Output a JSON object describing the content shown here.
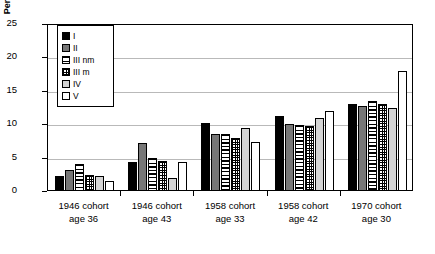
{
  "chart_data": {
    "type": "bar",
    "title": "",
    "xlabel": "",
    "ylabel": "Percentage",
    "ylim": [
      0,
      25
    ],
    "yticks": [
      "0",
      "5",
      "10",
      "15",
      "20",
      "25"
    ],
    "grid": true,
    "legend_position": "inside-top-left",
    "categories": [
      "1946 cohort age 36",
      "1946 cohort age 43",
      "1958 cohort age 33",
      "1958 cohort age 42",
      "1970 cohort age 30"
    ],
    "category_lines": [
      [
        "1946 cohort",
        "age 36"
      ],
      [
        "1946 cohort",
        "age 43"
      ],
      [
        "1958 cohort",
        "age 33"
      ],
      [
        "1958 cohort",
        "age 42"
      ],
      [
        "1970 cohort",
        "age 30"
      ]
    ],
    "series": [
      {
        "name": "I",
        "pattern": "solid-black",
        "values": [
          2.2,
          4.4,
          10.2,
          11.3,
          13.0
        ]
      },
      {
        "name": "II",
        "pattern": "gray-stipple",
        "values": [
          3.1,
          7.2,
          8.6,
          10.0,
          12.8
        ]
      },
      {
        "name": "III nm",
        "pattern": "horizontal-lines",
        "values": [
          4.0,
          5.0,
          8.6,
          9.9,
          13.5
        ]
      },
      {
        "name": "III m",
        "pattern": "crosshatch",
        "values": [
          2.4,
          4.5,
          7.9,
          9.8,
          13.0
        ]
      },
      {
        "name": "IV",
        "pattern": "light-gray",
        "values": [
          2.2,
          2.0,
          9.4,
          11.0,
          12.5
        ]
      },
      {
        "name": "V",
        "pattern": "white",
        "values": [
          1.5,
          4.3,
          7.4,
          12.0,
          18.0
        ]
      }
    ]
  },
  "legend": {
    "items": [
      {
        "label": "I"
      },
      {
        "label": "II"
      },
      {
        "label": "III nm"
      },
      {
        "label": "III m"
      },
      {
        "label": "IV"
      },
      {
        "label": "V"
      }
    ]
  }
}
